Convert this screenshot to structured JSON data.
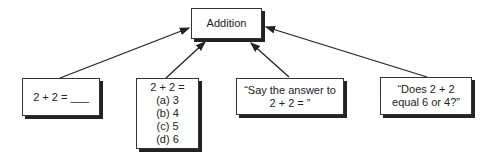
{
  "diagram": {
    "root": {
      "label": "Addition"
    },
    "children": [
      {
        "id": "fill-in",
        "lines": [
          "2 + 2 = ___"
        ]
      },
      {
        "id": "multiple-choice",
        "lines": [
          "2 + 2 =",
          "(a) 3",
          "(b) 4",
          "(c) 5",
          "(d) 6"
        ]
      },
      {
        "id": "verbal-prompt",
        "lines": [
          "“Say the answer to",
          "2 + 2 = ”"
        ]
      },
      {
        "id": "yes-no-question",
        "lines": [
          "“Does 2 + 2",
          "equal 6 or 4?”"
        ]
      }
    ],
    "edges": [
      {
        "from": "fill-in",
        "to": "root"
      },
      {
        "from": "multiple-choice",
        "to": "root"
      },
      {
        "from": "verbal-prompt",
        "to": "root"
      },
      {
        "from": "yes-no-question",
        "to": "root"
      }
    ]
  }
}
